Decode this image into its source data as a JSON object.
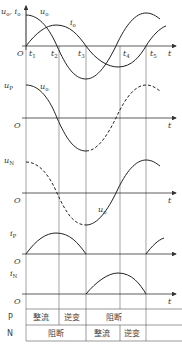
{
  "panels": [
    {
      "name": "panel-u0-i0",
      "y_label": "u₀, i₀",
      "curves": [
        "u₀",
        "i₀"
      ],
      "x_label": "t",
      "origin": "O",
      "ticks": [
        "t₁",
        "t₂",
        "t₃",
        "t₄",
        "t₅"
      ]
    },
    {
      "name": "panel-up",
      "y_label": "uₚ",
      "curve_label": "u₀",
      "x_label": "t",
      "origin": "O"
    },
    {
      "name": "panel-un",
      "y_label": "u_N",
      "curve_label": "u₀",
      "x_label": "t",
      "origin": "O"
    },
    {
      "name": "panel-ip",
      "y_label": "iₚ",
      "x_label": "t",
      "origin": "O"
    },
    {
      "name": "panel-in",
      "y_label": "i_N",
      "x_label": "t",
      "origin": "O"
    }
  ],
  "labels": {
    "u0i0": "u",
    "u0i0_sub": "o",
    "comma": ", i",
    "i_sub": "o",
    "u0": "u",
    "u0_sub": "o",
    "i0": "i",
    "i0_sub": "o",
    "up": "u",
    "up_sub": "P",
    "un": "u",
    "un_sub": "N",
    "ip": "i",
    "ip_sub": "P",
    "in": "i",
    "in_sub": "N",
    "t": "t",
    "O": "O",
    "t1": "t",
    "t1s": "1",
    "t2": "t",
    "t2s": "2",
    "t3": "t",
    "t3s": "3",
    "t4": "t",
    "t4s": "4",
    "t5": "t",
    "t5s": "5"
  },
  "table": {
    "rows": [
      {
        "label": "P",
        "cells": [
          "整流",
          "逆变",
          "阻断",
          ""
        ]
      },
      {
        "label": "N",
        "cells": [
          "阻断",
          "整流",
          "逆变",
          ""
        ]
      }
    ]
  }
}
